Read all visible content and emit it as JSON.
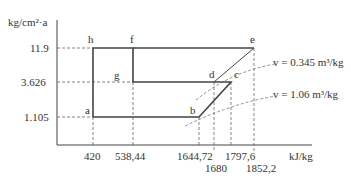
{
  "diagram": {
    "y_axis_label": "kg/cm²·a",
    "x_axis_label": "kJ/kg",
    "y_ticks": [
      "11.9",
      "3.626",
      "1.105"
    ],
    "x_ticks": [
      "420",
      "538,44",
      "1644,72",
      "1680",
      "1797,6",
      "1852,2"
    ],
    "points": {
      "a": "a",
      "b": "b",
      "c": "c",
      "d": "d",
      "e": "e",
      "f": "f",
      "g": "g",
      "h": "h"
    },
    "curves": [
      {
        "label": "v = 0.345 m³/kg"
      },
      {
        "label": "v = 1.06 m³/kg"
      }
    ],
    "colors": {
      "line": "#444444",
      "dash": "#666666",
      "text": "#333333"
    }
  }
}
